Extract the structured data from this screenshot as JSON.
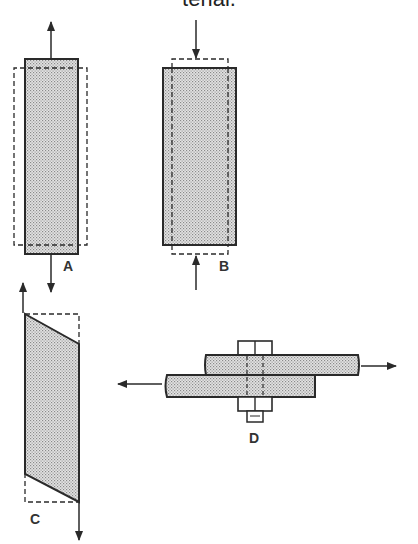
{
  "caption": "terial.",
  "figures": {
    "A": {
      "label": "A",
      "description": "tension: bar elongates (dashed = original shape wider and shorter)"
    },
    "B": {
      "label": "B",
      "description": "compression: bar shortens and widens (dashed = original shape)"
    },
    "C": {
      "label": "C",
      "description": "shear: rectangle deformed into parallelogram"
    },
    "D": {
      "label": "D",
      "description": "bolted lap joint in shear with opposing forces"
    }
  },
  "colors": {
    "ink": "#2a2a2a",
    "fill": "#c8c8c8",
    "background": "#ffffff"
  }
}
